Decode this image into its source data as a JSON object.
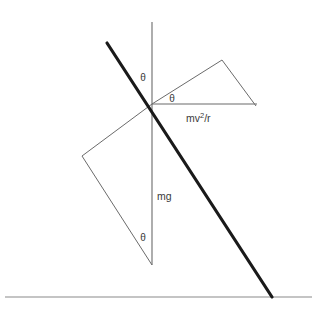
{
  "diagram": {
    "colors": {
      "rod": "#1a1a1a",
      "thin_line": "#6b6b6b",
      "ground": "#8a8a8a",
      "vertical": "#6b6b6b",
      "text": "#3a3a3a",
      "background": "#ffffff"
    },
    "geometry": {
      "pivot": {
        "x": 152,
        "y": 104
      },
      "vertical_line": {
        "x1": 152,
        "y1": 22,
        "x2": 152,
        "y2": 265
      },
      "rod_line": {
        "x1": 107,
        "y1": 43,
        "x2": 272,
        "y2": 297
      },
      "ground_line": {
        "x1": 5,
        "y1": 297,
        "x2": 312,
        "y2": 297
      },
      "horizontal_line": {
        "x1": 152,
        "y1": 104,
        "x2": 257,
        "y2": 104
      },
      "upper_triangle": "152,104 222,60 256,106",
      "lower_triangle": "152,104 82,156 152,265"
    },
    "labels": [
      {
        "id": "theta-upper-left",
        "text": "θ",
        "x": 143,
        "y": 78
      },
      {
        "id": "theta-center",
        "text": "θ",
        "x": 172,
        "y": 99
      },
      {
        "id": "theta-lower",
        "text": "θ",
        "x": 143,
        "y": 238
      },
      {
        "id": "weight-force",
        "text": "mg",
        "x": 157,
        "y": 197
      },
      {
        "id": "centripetal-force-base",
        "text": "mv",
        "x": 186,
        "y": 119
      },
      {
        "id": "centripetal-force-exponent",
        "text": "2",
        "x": 201,
        "y": 115
      },
      {
        "id": "centripetal-force-tail",
        "text": "/r",
        "x": 205,
        "y": 119
      }
    ],
    "label_values": {
      "theta": "θ",
      "weight": "mg",
      "centripetal_base": "mv",
      "centripetal_exponent": "2",
      "centripetal_tail": "/r",
      "centripetal_full": "mv2/r"
    }
  }
}
